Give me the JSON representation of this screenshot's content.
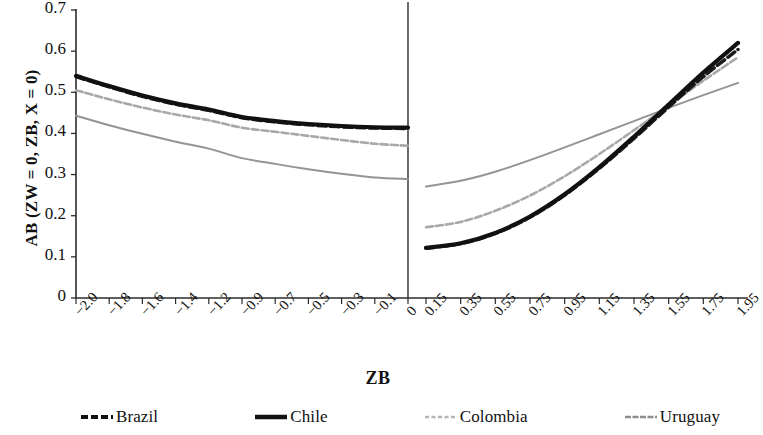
{
  "chart_data": {
    "type": "line",
    "title": "",
    "xlabel": "ZB",
    "ylabel": "AB (ZW = 0, ZB, X = 0)",
    "ylim": [
      0,
      0.7
    ],
    "ytick_labels": [
      "0.7",
      "0.6",
      "0.5",
      "0.4",
      "0.3",
      "0.2",
      "0.1",
      "0"
    ],
    "ytick_values": [
      0.7,
      0.6,
      0.5,
      0.4,
      0.3,
      0.2,
      0.1,
      0
    ],
    "grid": false,
    "legend_position": "bottom",
    "panels": [
      {
        "name": "left-panel",
        "xtick_labels": [
          "-2.0",
          "-1.8",
          "-1.6",
          "-1.4",
          "-1.2",
          "-0.9",
          "-0.7",
          "-0.5",
          "-0.3",
          "-0.1",
          "0"
        ],
        "x": [
          -2.0,
          -1.8,
          -1.6,
          -1.4,
          -1.2,
          -0.9,
          -0.7,
          -0.5,
          -0.3,
          -0.1,
          0
        ],
        "series": [
          {
            "name": "Chile",
            "values": [
              0.54,
              0.515,
              0.492,
              0.473,
              0.458,
              0.44,
              0.43,
              0.423,
              0.418,
              0.415,
              0.414
            ]
          },
          {
            "name": "Brazil",
            "values": [
              0.538,
              0.513,
              0.49,
              0.471,
              0.456,
              0.438,
              0.428,
              0.421,
              0.416,
              0.413,
              0.412
            ]
          },
          {
            "name": "Colombia",
            "values": [
              0.505,
              0.483,
              0.463,
              0.446,
              0.432,
              0.414,
              0.404,
              0.394,
              0.384,
              0.375,
              0.37
            ]
          },
          {
            "name": "Uruguay",
            "values": [
              0.443,
              0.42,
              0.399,
              0.38,
              0.363,
              0.34,
              0.326,
              0.313,
              0.302,
              0.293,
              0.289
            ]
          }
        ]
      },
      {
        "name": "right-panel",
        "xtick_labels": [
          "0.15",
          "0.35",
          "0.55",
          "0.75",
          "0.95",
          "1.15",
          "1.35",
          "1.55",
          "1.75",
          "1.95"
        ],
        "x": [
          0.15,
          0.35,
          0.55,
          0.75,
          0.95,
          1.15,
          1.35,
          1.55,
          1.75,
          1.95
        ],
        "series": [
          {
            "name": "Chile",
            "values": [
              0.122,
              0.133,
              0.158,
              0.198,
              0.252,
              0.318,
              0.392,
              0.47,
              0.548,
              0.62
            ]
          },
          {
            "name": "Brazil",
            "values": [
              0.121,
              0.132,
              0.157,
              0.196,
              0.25,
              0.315,
              0.388,
              0.464,
              0.538,
              0.604
            ]
          },
          {
            "name": "Colombia",
            "values": [
              0.172,
              0.185,
              0.212,
              0.249,
              0.296,
              0.35,
              0.408,
              0.468,
              0.528,
              0.585
            ]
          },
          {
            "name": "Uruguay",
            "values": [
              0.271,
              0.285,
              0.307,
              0.335,
              0.366,
              0.398,
              0.43,
              0.462,
              0.493,
              0.523
            ]
          }
        ]
      }
    ]
  },
  "legend": {
    "items": [
      {
        "label": "Brazil",
        "style": "dashed-thick",
        "color": "#111111"
      },
      {
        "label": "Chile",
        "style": "solid-thick",
        "color": "#111111"
      },
      {
        "label": "Colombia",
        "style": "dotted-thin",
        "color": "#b5b5b5"
      },
      {
        "label": "Uruguay",
        "style": "dashed-thin",
        "color": "#8d8d8d"
      }
    ]
  },
  "colors": {
    "chile": "#111111",
    "brazil": "#1a1a1a",
    "colombia": "#a8a8a8",
    "uruguay": "#949494",
    "axis": "#2b2b2b",
    "background": "#ffffff"
  }
}
